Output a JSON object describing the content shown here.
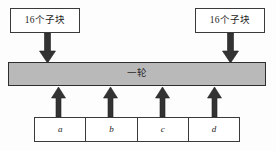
{
  "diagram": {
    "colors": {
      "bar_fill": "#b9b9b9",
      "box_fill": "#ffffff",
      "stroke": "#3a3a3a",
      "arrow": "#333333",
      "background": "#fdfdfd"
    },
    "top_boxes": [
      {
        "label": "16个子块"
      },
      {
        "label": "16个子块"
      }
    ],
    "round_bar": {
      "label": "一轮"
    },
    "bottom_boxes": [
      {
        "label": "a"
      },
      {
        "label": "b"
      },
      {
        "label": "c"
      },
      {
        "label": "d"
      }
    ],
    "arrows": {
      "down": [
        {
          "name": "down-arrow-left",
          "x": 47,
          "direction": "down"
        },
        {
          "name": "down-arrow-right",
          "x": 230,
          "direction": "down"
        }
      ],
      "up": [
        {
          "name": "up-arrow-a",
          "x": 58,
          "direction": "up"
        },
        {
          "name": "up-arrow-b",
          "x": 110,
          "direction": "up"
        },
        {
          "name": "up-arrow-c",
          "x": 162,
          "direction": "up"
        },
        {
          "name": "up-arrow-d",
          "x": 214,
          "direction": "up"
        }
      ]
    }
  }
}
